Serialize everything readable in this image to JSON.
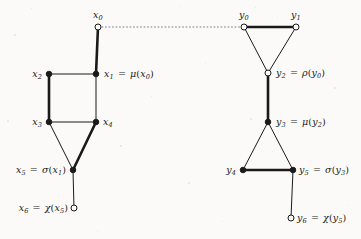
{
  "figure": {
    "name": "dual-graph-diagram",
    "background_color": "#fbfaf8",
    "ink_color": "#1a1a1a",
    "width": 361,
    "height": 239
  },
  "left_graph": {
    "name": "x-graph",
    "nodes": [
      {
        "id": "x0",
        "label_html": "x<sub>0</sub>",
        "cx": 98,
        "cy": 27,
        "style": "hollow",
        "label_x": 98,
        "label_y": 10,
        "anchor": "mid"
      },
      {
        "id": "x1",
        "label_html": "x<sub>1</sub> <span class=\"op\">=</span> <span class=\"fn\">μ</span><span class=\"paren\">(</span>x<sub>0</sub><span class=\"paren\">)</span>",
        "cx": 96,
        "cy": 74,
        "style": "filled",
        "label_x": 104,
        "label_y": 69,
        "anchor": "start"
      },
      {
        "id": "x2",
        "label_html": "x<sub>2</sub>",
        "cx": 49,
        "cy": 74,
        "style": "filled",
        "label_x": 42,
        "label_y": 69,
        "anchor": "end"
      },
      {
        "id": "x3",
        "label_html": "x<sub>3</sub>",
        "cx": 49,
        "cy": 122,
        "style": "filled",
        "label_x": 42,
        "label_y": 117,
        "anchor": "end"
      },
      {
        "id": "x4",
        "label_html": "x<sub>4</sub>",
        "cx": 96,
        "cy": 122,
        "style": "filled",
        "label_x": 103,
        "label_y": 117,
        "anchor": "start"
      },
      {
        "id": "x5",
        "label_html": "x<sub>5</sub> <span class=\"op\">=</span> <span class=\"fn\">σ</span><span class=\"paren\">(</span>x<sub>1</sub><span class=\"paren\">)</span>",
        "cx": 73,
        "cy": 170,
        "style": "filled",
        "label_x": 66,
        "label_y": 165,
        "anchor": "end"
      },
      {
        "id": "x6",
        "label_html": "x<sub>6</sub> <span class=\"op\">=</span> <span class=\"fn\">χ</span><span class=\"paren\">(</span>x<sub>5</sub><span class=\"paren\">)</span>",
        "cx": 74,
        "cy": 208,
        "style": "hollow",
        "label_x": 68,
        "label_y": 203,
        "anchor": "end"
      }
    ],
    "edges": [
      {
        "from": "x0",
        "to": "x1",
        "weight": "thick"
      },
      {
        "from": "x2",
        "to": "x1",
        "weight": "thin"
      },
      {
        "from": "x2",
        "to": "x3",
        "weight": "thick"
      },
      {
        "from": "x1",
        "to": "x4",
        "weight": "thin"
      },
      {
        "from": "x3",
        "to": "x4",
        "weight": "thin"
      },
      {
        "from": "x3",
        "to": "x5",
        "weight": "thin"
      },
      {
        "from": "x4",
        "to": "x5",
        "weight": "thick"
      },
      {
        "from": "x5",
        "to": "x6",
        "weight": "thin"
      }
    ]
  },
  "right_graph": {
    "name": "y-graph",
    "nodes": [
      {
        "id": "y0",
        "label_html": "y<sub>0</sub>",
        "cx": 244,
        "cy": 27,
        "style": "hollow",
        "label_x": 244,
        "label_y": 10,
        "anchor": "mid"
      },
      {
        "id": "y1",
        "label_html": "y<sub>1</sub>",
        "cx": 296,
        "cy": 27,
        "style": "hollow",
        "label_x": 296,
        "label_y": 10,
        "anchor": "mid"
      },
      {
        "id": "y2",
        "label_html": "y<sub>2</sub> <span class=\"op\">=</span> <span class=\"fn\">ρ</span><span class=\"paren\">(</span>y<sub>0</sub><span class=\"paren\">)</span>",
        "cx": 268,
        "cy": 73,
        "style": "hollow",
        "label_x": 276,
        "label_y": 68,
        "anchor": "start"
      },
      {
        "id": "y3",
        "label_html": "y<sub>3</sub> <span class=\"op\">=</span> <span class=\"fn\">μ</span><span class=\"paren\">(</span>y<sub>2</sub><span class=\"paren\">)</span>",
        "cx": 268,
        "cy": 122,
        "style": "filled",
        "label_x": 276,
        "label_y": 117,
        "anchor": "start"
      },
      {
        "id": "y4",
        "label_html": "y<sub>4</sub>",
        "cx": 243,
        "cy": 170,
        "style": "filled",
        "label_x": 236,
        "label_y": 165,
        "anchor": "end"
      },
      {
        "id": "y5",
        "label_html": "y<sub>5</sub> <span class=\"op\">=</span> <span class=\"fn\">σ</span><span class=\"paren\">(</span>y<sub>3</sub><span class=\"paren\">)</span>",
        "cx": 293,
        "cy": 170,
        "style": "filled",
        "label_x": 299,
        "label_y": 165,
        "anchor": "start"
      },
      {
        "id": "y6",
        "label_html": "y<sub>6</sub> <span class=\"op\">=</span> <span class=\"fn\">χ</span><span class=\"paren\">(</span>y<sub>5</sub><span class=\"paren\">)</span>",
        "cx": 291,
        "cy": 218,
        "style": "hollow",
        "label_x": 297,
        "label_y": 213,
        "anchor": "start"
      }
    ],
    "edges": [
      {
        "from": "y0",
        "to": "y1",
        "weight": "thick"
      },
      {
        "from": "y0",
        "to": "y2",
        "weight": "thin"
      },
      {
        "from": "y1",
        "to": "y2",
        "weight": "thin"
      },
      {
        "from": "y2",
        "to": "y3",
        "weight": "thick"
      },
      {
        "from": "y3",
        "to": "y4",
        "weight": "thin"
      },
      {
        "from": "y3",
        "to": "y5",
        "weight": "thin"
      },
      {
        "from": "y4",
        "to": "y5",
        "weight": "thick"
      },
      {
        "from": "y5",
        "to": "y6",
        "weight": "thin"
      }
    ]
  },
  "connector": {
    "name": "dotted-connector",
    "from": "x0",
    "to": "y0",
    "style": "dotted",
    "x1": 102,
    "y1": 27,
    "x2": 240,
    "y2": 27
  },
  "style_tokens": {
    "thin_width": 1.0,
    "thick_width": 2.6,
    "node_radius": 3.0,
    "hollow_fill": "#fbfaf8"
  }
}
